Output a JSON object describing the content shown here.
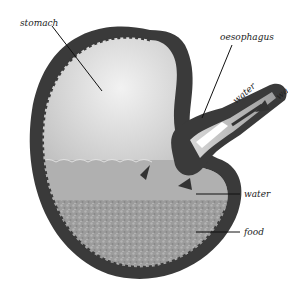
{
  "diagram": {
    "labels": {
      "stomach": "stomach",
      "oesophagus": "oesophagus",
      "water_inflow": "water",
      "water_outer": "wa",
      "water_layer": "water",
      "food_layer": "food"
    }
  }
}
